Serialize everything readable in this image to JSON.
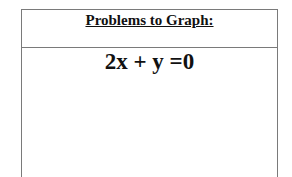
{
  "table": {
    "header": "Problems to Graph:",
    "problems": [
      "2x + y =0"
    ]
  }
}
